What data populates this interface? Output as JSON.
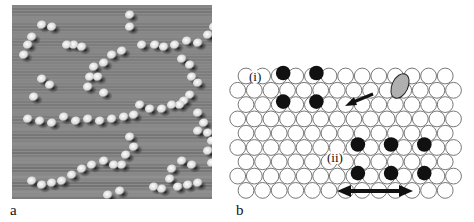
{
  "figure": {
    "panel_a": {
      "label": "a",
      "description": "STM image of adsorbed atoms forming chains on a surface",
      "background_color": "#8a8a8a",
      "adatoms": [
        [
          30,
          20
        ],
        [
          40,
          22
        ],
        [
          62,
          40
        ],
        [
          70,
          42
        ],
        [
          20,
          32
        ],
        [
          16,
          40
        ],
        [
          12,
          50
        ],
        [
          55,
          40
        ],
        [
          118,
          10
        ],
        [
          118,
          22
        ],
        [
          130,
          40
        ],
        [
          143,
          40
        ],
        [
          152,
          42
        ],
        [
          163,
          40
        ],
        [
          175,
          36
        ],
        [
          186,
          38
        ],
        [
          196,
          30
        ],
        [
          202,
          22
        ],
        [
          100,
          50
        ],
        [
          110,
          46
        ],
        [
          92,
          58
        ],
        [
          82,
          62
        ],
        [
          78,
          72
        ],
        [
          86,
          72
        ],
        [
          76,
          82
        ],
        [
          92,
          88
        ],
        [
          170,
          54
        ],
        [
          178,
          60
        ],
        [
          180,
          72
        ],
        [
          186,
          78
        ],
        [
          178,
          90
        ],
        [
          172,
          96
        ],
        [
          168,
          100
        ],
        [
          160,
          100
        ],
        [
          150,
          104
        ],
        [
          138,
          104
        ],
        [
          128,
          100
        ],
        [
          30,
          74
        ],
        [
          38,
          80
        ],
        [
          22,
          92
        ],
        [
          16,
          114
        ],
        [
          28,
          116
        ],
        [
          40,
          118
        ],
        [
          52,
          112
        ],
        [
          64,
          116
        ],
        [
          76,
          114
        ],
        [
          88,
          116
        ],
        [
          100,
          114
        ],
        [
          112,
          112
        ],
        [
          122,
          110
        ],
        [
          186,
          108
        ],
        [
          192,
          118
        ],
        [
          196,
          128
        ],
        [
          200,
          136
        ],
        [
          186,
          126
        ],
        [
          118,
          132
        ],
        [
          122,
          142
        ],
        [
          114,
          150
        ],
        [
          110,
          160
        ],
        [
          102,
          160
        ],
        [
          92,
          156
        ],
        [
          80,
          160
        ],
        [
          70,
          164
        ],
        [
          60,
          170
        ],
        [
          50,
          176
        ],
        [
          40,
          178
        ],
        [
          30,
          180
        ],
        [
          20,
          176
        ],
        [
          196,
          146
        ],
        [
          200,
          158
        ],
        [
          180,
          160
        ],
        [
          170,
          156
        ],
        [
          160,
          164
        ],
        [
          158,
          174
        ],
        [
          166,
          182
        ],
        [
          176,
          180
        ],
        [
          186,
          178
        ],
        [
          150,
          184
        ],
        [
          142,
          182
        ],
        [
          108,
          186
        ],
        [
          96,
          190
        ]
      ]
    },
    "panel_b": {
      "label": "b",
      "description": "Schematic of hexagonal close-packed surface lattice with adatoms",
      "lattice": {
        "rows": 9,
        "cols_odd_rows": 13,
        "cols_even_rows": 14,
        "diameter": 16.6,
        "row_spacing": 14.3,
        "origin_x": 18,
        "origin_y": 16,
        "stroke_color": "#555555",
        "fill_color": "#ffffff"
      },
      "black_atoms": [
        {
          "row": 1,
          "col": 3
        },
        {
          "row": 1,
          "col": 5
        },
        {
          "row": 3,
          "col": 3
        },
        {
          "row": 3,
          "col": 5
        },
        {
          "row": 6,
          "col": 8
        },
        {
          "row": 6,
          "col": 10
        },
        {
          "row": 6,
          "col": 12
        },
        {
          "row": 8,
          "col": 8
        },
        {
          "row": 8,
          "col": 10
        },
        {
          "row": 8,
          "col": 12
        }
      ],
      "dimer": {
        "x": 172,
        "y": 26,
        "rx": 8,
        "ry": 13,
        "rotate": 25,
        "color": "#999999"
      },
      "arrow_small": {
        "x1": 145,
        "y1": 34,
        "x2": 117,
        "y2": 46
      },
      "double_arrow": {
        "x1": 109,
        "x2": 185,
        "y": 131
      },
      "annotations": [
        {
          "text": "(i)",
          "x": 20,
          "y": 10
        },
        {
          "text": "(ii)",
          "x": 98,
          "y": 91
        }
      ]
    }
  }
}
